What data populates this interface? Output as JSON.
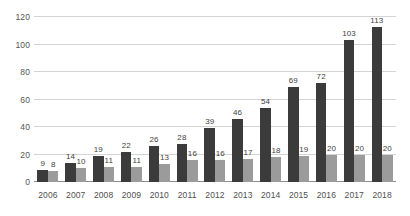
{
  "chart_data": {
    "type": "bar",
    "title": "",
    "subtitle": "",
    "xlabel": "",
    "ylabel": "",
    "ylim": [
      0,
      120
    ],
    "yticks": [
      0,
      20,
      40,
      60,
      80,
      100,
      120
    ],
    "grid": true,
    "legend": "none",
    "data_labels": true,
    "orientation": "vertical",
    "grouping": "grouped",
    "categories": [
      "2006",
      "2007",
      "2008",
      "2009",
      "2010",
      "2011",
      "2012",
      "2013",
      "2014",
      "2015",
      "2016",
      "2017",
      "2018"
    ],
    "series": [
      {
        "name": "series-1",
        "color": "#3b3b3b",
        "values": [
          9,
          14,
          19,
          22,
          26,
          28,
          39,
          46,
          54,
          69,
          72,
          103,
          113
        ]
      },
      {
        "name": "series-2",
        "color": "#9b9b9b",
        "values": [
          8,
          10,
          11,
          11,
          13,
          16,
          16,
          17,
          18,
          19,
          20,
          20,
          20
        ]
      }
    ]
  },
  "axis": {
    "gridline_color": "#d4d4d4",
    "baseline_color": "#8c8c8c",
    "tick_text_color": "#555555"
  }
}
